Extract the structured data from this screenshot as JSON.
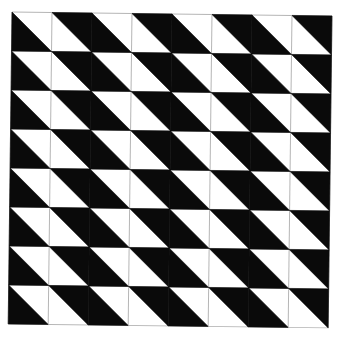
{
  "figure": {
    "type": "tessellation",
    "rows": 8,
    "cols": 8,
    "cell_size_px": 40,
    "origin": {
      "x": 12,
      "y": 12
    },
    "rotation_deg": 0.7,
    "colors": {
      "fill_dark": "#0a0a0a",
      "fill_light": "#ffffff",
      "grid_line": "#b5b5b5",
      "background": "#ffffff"
    },
    "column_pattern": [
      {
        "col": 0,
        "black_triangle": "bottom-left"
      },
      {
        "col": 1,
        "black_triangle": "top-right"
      },
      {
        "col": 2,
        "black_triangle": "bottom-left"
      },
      {
        "col": 3,
        "black_triangle": "top-right"
      },
      {
        "col": 4,
        "black_triangle": "bottom-left"
      },
      {
        "col": 5,
        "black_triangle": "top-right"
      },
      {
        "col": 6,
        "black_triangle": "bottom-left"
      },
      {
        "col": 7,
        "black_triangle": "top-right"
      }
    ],
    "visible_vertical_lines_after_cols": [
      0,
      2,
      4,
      6
    ],
    "horizontal_lines": "all row boundaries"
  }
}
